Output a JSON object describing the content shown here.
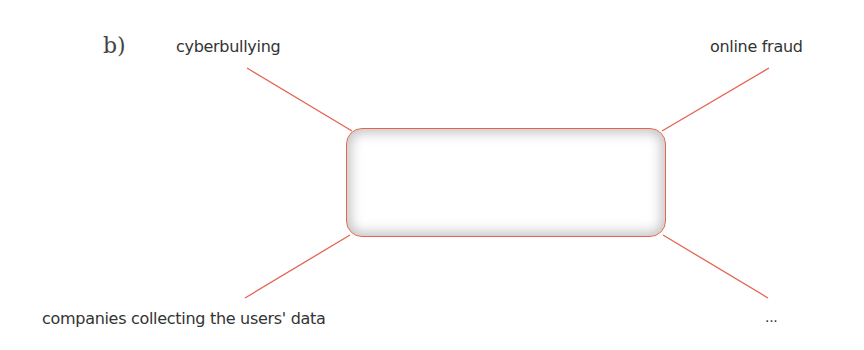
{
  "part_label": "b)",
  "diagram": {
    "type": "mind-map",
    "center": {
      "text": ""
    },
    "branches": [
      {
        "position": "top-left",
        "label": "cyberbullying"
      },
      {
        "position": "top-right",
        "label": "online fraud"
      },
      {
        "position": "bottom-left",
        "label": "companies collecting the users' data"
      },
      {
        "position": "bottom-right",
        "label": "..."
      }
    ],
    "line_color": "#e4644f"
  }
}
